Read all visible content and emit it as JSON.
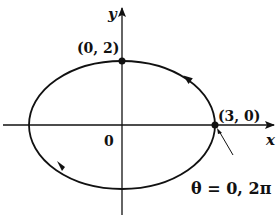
{
  "diagram": {
    "type": "parametric ellipse",
    "axes": {
      "x_label": "x",
      "y_label": "y",
      "origin_label": "0"
    },
    "points": [
      {
        "label": "(0, 2)",
        "x": 0,
        "y": 2
      },
      {
        "label": "(3, 0)",
        "x": 3,
        "y": 0
      }
    ],
    "annotation": "θ = 0, 2π",
    "direction": "counterclockwise",
    "ellipse": {
      "a": 3,
      "b": 2
    },
    "colors": {
      "stroke": "#111111",
      "background": "#ffffff"
    }
  }
}
